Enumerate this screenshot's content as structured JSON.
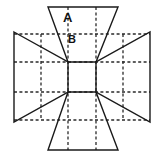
{
  "figure": {
    "canvas": {
      "width": 160,
      "height": 159
    },
    "colors": {
      "background": "#ffffff",
      "stroke": "#1a1a1a",
      "grid": "#2a2a2a",
      "label": "#111111"
    },
    "stroke_width": 1.4,
    "grid_stroke_width": 1.3,
    "grid_dash": "3,2.4",
    "labels": [
      {
        "id": "label-a",
        "text": "A",
        "x": 63,
        "y": 22,
        "font_size": 13
      },
      {
        "id": "label-b",
        "text": "B",
        "x": 68,
        "y": 43,
        "font_size": 11
      }
    ],
    "shapes": [
      {
        "id": "top-trapezoid",
        "name": "top-trapezoid",
        "points": "48,7 118,7 96,62 68,62"
      },
      {
        "id": "left-trapezoid",
        "name": "left-trapezoid",
        "points": "14,32 68,62 68,92 14,122"
      },
      {
        "id": "right-trapezoid",
        "name": "right-trapezoid",
        "points": "150,32 150,122 96,92 96,62"
      },
      {
        "id": "bottom-trapezoid",
        "name": "bottom-trapezoid",
        "points": "68,92 96,92 118,150 48,150"
      }
    ],
    "grid": {
      "vertical_lines": [
        {
          "x": 41,
          "y1": 34,
          "y2": 120
        },
        {
          "x": 68,
          "y1": 7,
          "y2": 150
        },
        {
          "x": 96,
          "y1": 7,
          "y2": 150
        },
        {
          "x": 123,
          "y1": 34,
          "y2": 120
        }
      ],
      "horizontal_lines": [
        {
          "y": 34,
          "x1": 14,
          "x2": 150
        },
        {
          "y": 62,
          "x1": 14,
          "x2": 150
        },
        {
          "y": 92,
          "x1": 14,
          "x2": 150
        },
        {
          "y": 120,
          "x1": 14,
          "x2": 150
        }
      ]
    },
    "vertices": [
      {
        "id": "center-top-left",
        "x": 68,
        "y": 62
      },
      {
        "id": "center-top-right",
        "x": 96,
        "y": 62
      },
      {
        "id": "center-bottom-left",
        "x": 68,
        "y": 92
      },
      {
        "id": "center-bottom-right",
        "x": 96,
        "y": 92
      }
    ]
  }
}
